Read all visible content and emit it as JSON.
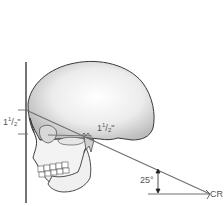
{
  "diagram": {
    "labels": {
      "left_distance_whole": "1",
      "left_distance_num": "1",
      "left_distance_den": "2",
      "left_distance_unit": "\"",
      "ear_distance_whole": "1",
      "ear_distance_num": "1",
      "ear_distance_den": "2",
      "ear_distance_unit": "\"",
      "angle": "25°",
      "central_ray": "CR"
    },
    "colors": {
      "line": "#6e6e6e",
      "outline": "#3a3a3a",
      "bone_fill": "#f2f2f2",
      "shadow": "#c8c8c8",
      "text": "#555555"
    }
  }
}
